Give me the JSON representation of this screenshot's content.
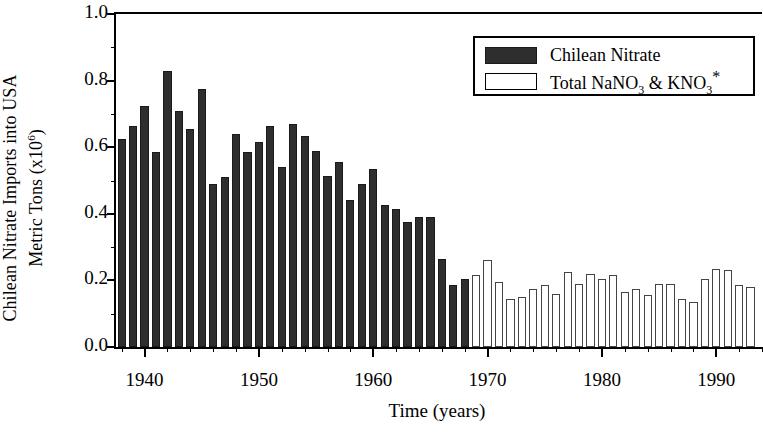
{
  "chart_data": {
    "type": "bar",
    "title": "",
    "xlabel": "Time (years)",
    "ylabel": "Chilean Nitrate Imports into USA Metric Tons (x10^6)",
    "ylabel_line1": "Chilean Nitrate Imports into USA",
    "ylabel_line2_pre": "Metric Tons (x10",
    "ylabel_line2_sup": "6",
    "ylabel_line2_post": ")",
    "ylim": [
      0.0,
      1.0
    ],
    "xlim": [
      1937.5,
      1994.0
    ],
    "ytick_labels": [
      "1.0",
      "0.8",
      "0.6",
      "0.4",
      "0.2",
      "0.0"
    ],
    "ytick_values": [
      1.0,
      0.8,
      0.6,
      0.4,
      0.2,
      0.0
    ],
    "ytick_minor_values": [
      0.9,
      0.7,
      0.5,
      0.3,
      0.1
    ],
    "xtick_labels": [
      "1940",
      "1950",
      "1960",
      "1970",
      "1980",
      "1990"
    ],
    "xtick_values": [
      1940,
      1950,
      1960,
      1970,
      1980,
      1990
    ],
    "grid": false,
    "legend_position": "top-right",
    "units": "million metric tons",
    "bar_colors": {
      "chilean_nitrate": "#2e2e2e",
      "total_nano3_kno3": "#ffffff",
      "outline": "#000000"
    },
    "series": [
      {
        "name": "Chilean Nitrate",
        "style": "filled",
        "x": [
          1938,
          1939,
          1940,
          1941,
          1942,
          1943,
          1944,
          1945,
          1946,
          1947,
          1948,
          1949,
          1950,
          1951,
          1952,
          1953,
          1954,
          1955,
          1956,
          1957,
          1958,
          1959,
          1960,
          1961,
          1962,
          1963,
          1964,
          1965,
          1966,
          1967,
          1968
        ],
        "values": [
          0.625,
          0.665,
          0.725,
          0.585,
          0.83,
          0.71,
          0.655,
          0.775,
          0.49,
          0.51,
          0.64,
          0.585,
          0.615,
          0.665,
          0.54,
          0.67,
          0.635,
          0.59,
          0.515,
          0.555,
          0.44,
          0.49,
          0.535,
          0.425,
          0.415,
          0.375,
          0.39,
          0.39,
          0.265,
          0.185,
          0.205
        ]
      },
      {
        "name": "Total NaNO3 & KNO3 *",
        "style": "open",
        "x": [
          1969,
          1970,
          1971,
          1972,
          1973,
          1974,
          1975,
          1976,
          1977,
          1978,
          1979,
          1980,
          1981,
          1982,
          1983,
          1984,
          1985,
          1986,
          1987,
          1988,
          1989,
          1990,
          1991,
          1992,
          1993
        ],
        "values": [
          0.215,
          0.26,
          0.195,
          0.145,
          0.15,
          0.175,
          0.185,
          0.16,
          0.225,
          0.19,
          0.22,
          0.205,
          0.215,
          0.165,
          0.175,
          0.155,
          0.19,
          0.19,
          0.145,
          0.135,
          0.205,
          0.235,
          0.23,
          0.185,
          0.18
        ]
      }
    ]
  },
  "legend": {
    "items": [
      {
        "label": "Chilean Nitrate",
        "style": "filled"
      },
      {
        "label_pre": "Total NaNO",
        "sub1": "3",
        "label_mid": " & KNO",
        "sub2": "3",
        "star": "*",
        "style": "open"
      }
    ]
  },
  "axes": {
    "x_title": "Time (years)"
  }
}
